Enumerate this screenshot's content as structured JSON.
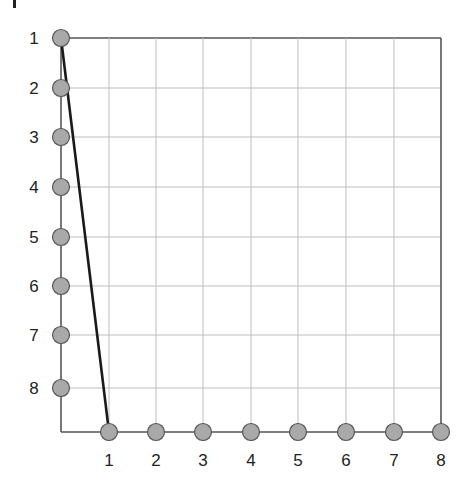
{
  "diagram": {
    "type": "bipartite-edge-grid",
    "left_nodes": [
      "1",
      "2",
      "3",
      "4",
      "5",
      "6",
      "7",
      "8"
    ],
    "bottom_nodes": [
      "1",
      "2",
      "3",
      "4",
      "5",
      "6",
      "7",
      "8"
    ],
    "edges": [
      {
        "from": "left-1",
        "to": "bottom-1"
      }
    ],
    "colors": {
      "node_fill": "#a9a9a9",
      "node_stroke": "#555555",
      "axis": "#555555",
      "grid": "#bdbdbd",
      "edge": "#1a1a1a",
      "label": "#222222"
    }
  }
}
